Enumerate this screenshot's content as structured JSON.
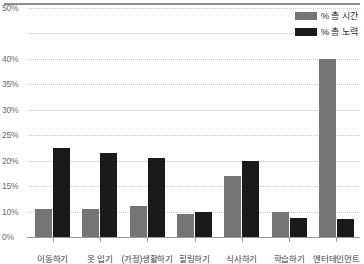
{
  "chart_data": {
    "type": "bar",
    "title": "",
    "xlabel": "",
    "ylabel": "",
    "grid": true,
    "legend_position": "top-right",
    "categories": [
      "이동하기",
      "옷 입기",
      "(가정)생활하기",
      "힐링하기",
      "식사하기",
      "학습하기",
      "엔터테인먼트"
    ],
    "series": [
      {
        "name": "% 총 시간",
        "color": "#757575",
        "values": [
          10.5,
          10.5,
          11,
          9,
          17,
          10,
          40
        ]
      },
      {
        "name": "% 총 노력",
        "color": "#1a1a1a",
        "values": [
          22.5,
          21.5,
          20.5,
          10,
          20,
          7.5,
          7
        ]
      }
    ],
    "ytick_labels": [
      "50%",
      "",
      "40%",
      "35%",
      "30%",
      "25%",
      "20%",
      "15%",
      "10%",
      "0%"
    ],
    "ytick_values": [
      50,
      45,
      40,
      35,
      30,
      25,
      20,
      15,
      10,
      0
    ],
    "ylim": [
      0,
      50
    ],
    "note": "Y axis tick labels are non-uniform: the gridline between 50% and 40% is unlabeled; gridlines are evenly spaced in pixels."
  },
  "legend": {
    "items": [
      {
        "label": "% 총 시간",
        "color": "#757575"
      },
      {
        "label": "% 총 노력",
        "color": "#1a1a1a"
      }
    ]
  }
}
